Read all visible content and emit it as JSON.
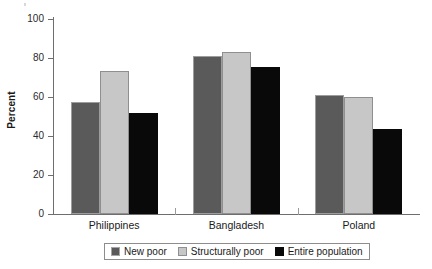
{
  "chart_data": {
    "type": "bar",
    "title": "",
    "subtitle": "",
    "xlabel": "",
    "ylabel": "Percent",
    "ylim": [
      0,
      100
    ],
    "yticks": [
      0,
      20,
      40,
      60,
      80,
      100
    ],
    "ytick_labels": [
      "0",
      "20",
      "40",
      "60",
      "80",
      "100"
    ],
    "grid": false,
    "legend_position": "bottom",
    "categories": [
      "Philippines",
      "Bangladesh",
      "Poland"
    ],
    "series": [
      {
        "name": "New poor",
        "color": "#5a5a5a",
        "values": [
          57.5,
          81.0,
          61.0
        ]
      },
      {
        "name": "Structurally poor",
        "color": "#c7c7c7",
        "values": [
          73.5,
          83.0,
          60.0
        ]
      },
      {
        "name": "Entire population",
        "color": "#090909",
        "values": [
          52.0,
          75.5,
          43.5
        ]
      }
    ]
  }
}
